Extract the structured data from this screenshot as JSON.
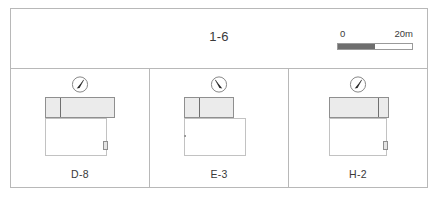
{
  "figure": {
    "group_title": "1-6",
    "scalebar": {
      "min_label": "0",
      "max_label": "20m",
      "dark_color": "#6e6e6e",
      "light_color": "#ffffff",
      "border_color": "#9a9a9a"
    },
    "frame_color": "#b8b8b8",
    "panels": [
      {
        "id": "panel-d-8",
        "label": "D-8",
        "north_arrow": {
          "icon": "north-arrow-icon",
          "needle_angle_deg": 28
        },
        "plan": {
          "upper_band": {
            "x": 4,
            "y": 0,
            "w": 70,
            "h": 21,
            "fill": "#ebebeb",
            "stroke": "#8f8f8f"
          },
          "band_divider_x": 14,
          "lower_block": {
            "x": 4,
            "y": 21,
            "w": 62,
            "h": 38,
            "fill": "#ffffff",
            "stroke": "#c2c2c2"
          },
          "corner_marker": {
            "x": 62,
            "y": 44,
            "w": 5,
            "h": 9
          },
          "tick_marker": null
        }
      },
      {
        "id": "panel-e-3",
        "label": "E-3",
        "north_arrow": {
          "icon": "north-arrow-icon",
          "needle_angle_deg": -28
        },
        "plan": {
          "upper_band": {
            "x": 4,
            "y": 0,
            "w": 50,
            "h": 21,
            "fill": "#ebebeb",
            "stroke": "#8f8f8f"
          },
          "band_divider_x": 14,
          "lower_block": {
            "x": 4,
            "y": 21,
            "w": 62,
            "h": 38,
            "fill": "#ffffff",
            "stroke": "#c2c2c2"
          },
          "corner_marker": null,
          "tick_marker": {
            "x": 4,
            "y": 38,
            "w": 2,
            "h": 2
          }
        }
      },
      {
        "id": "panel-h-2",
        "label": "H-2",
        "north_arrow": {
          "icon": "north-arrow-icon",
          "needle_angle_deg": 28
        },
        "plan": {
          "upper_band": {
            "x": 10,
            "y": 0,
            "w": 60,
            "h": 21,
            "fill": "#ebebeb",
            "stroke": "#8f8f8f"
          },
          "band_divider_x": 48,
          "lower_block": {
            "x": 10,
            "y": 21,
            "w": 58,
            "h": 38,
            "fill": "#ffffff",
            "stroke": "#c2c2c2"
          },
          "corner_marker": {
            "x": 64,
            "y": 44,
            "w": 5,
            "h": 9
          },
          "tick_marker": null
        }
      }
    ]
  }
}
